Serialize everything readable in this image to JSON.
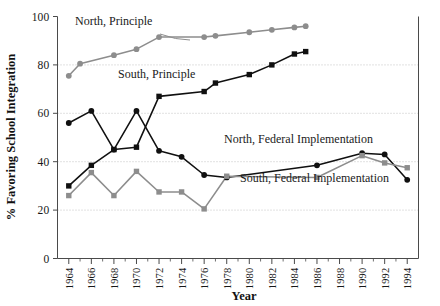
{
  "chart_data": {
    "type": "line",
    "title": "",
    "xlabel": "Year",
    "ylabel": "% Favoring School Integration",
    "xlim": [
      1963,
      1995
    ],
    "ylim": [
      0,
      100
    ],
    "grid": true,
    "legend_position": "inline-annotations",
    "y_ticks": [
      0,
      20,
      40,
      60,
      80,
      100
    ],
    "y_tick_labels": [
      "0",
      "20",
      "40",
      "60",
      "80",
      "100"
    ],
    "x_ticks": [
      1964,
      1966,
      1968,
      1970,
      1972,
      1974,
      1976,
      1978,
      1980,
      1982,
      1984,
      1986,
      1988,
      1990,
      1992,
      1994
    ],
    "x_tick_labels": [
      "1964",
      "1966",
      "1968",
      "1970",
      "1972",
      "1974",
      "1976",
      "1978",
      "1980",
      "1982",
      "1984",
      "1986",
      "1988",
      "1990",
      "1992",
      "1994"
    ],
    "series": [
      {
        "name": "North, Principle",
        "label": "North, Principle",
        "color": "#8d8d8d",
        "marker": "circle",
        "x": [
          1964,
          1965,
          1968,
          1970,
          1972,
          1976,
          1977,
          1980,
          1982,
          1984,
          1985
        ],
        "values": [
          75.5,
          80.5,
          84,
          86.5,
          91.5,
          91.5,
          92,
          93.5,
          94.5,
          95.5,
          96
        ]
      },
      {
        "name": "South, Principle",
        "label": "South, Principle",
        "color": "#101010",
        "marker": "square",
        "x": [
          1964,
          1966,
          1968,
          1970,
          1972,
          1976,
          1977,
          1980,
          1982,
          1984,
          1985
        ],
        "values": [
          30,
          38.5,
          45,
          46,
          67,
          69,
          72.5,
          76,
          80,
          84.5,
          85.5
        ]
      },
      {
        "name": "North, Federal Implementation",
        "label": "North, Federal Implementation",
        "color": "#101010",
        "marker": "circle",
        "x": [
          1964,
          1966,
          1968,
          1970,
          1972,
          1974,
          1976,
          1978,
          1986,
          1990,
          1992,
          1994
        ],
        "values": [
          56,
          61,
          45,
          61,
          44.5,
          42,
          34.5,
          33.5,
          38.5,
          43.5,
          43,
          32.5
        ]
      },
      {
        "name": "South, Federal Implementation",
        "label": "South, Federal Implementation",
        "color": "#8d8d8d",
        "marker": "square",
        "x": [
          1964,
          1966,
          1968,
          1970,
          1972,
          1974,
          1976,
          1978,
          1986,
          1990,
          1992,
          1994
        ],
        "values": [
          26,
          35.5,
          26,
          36,
          27.5,
          27.5,
          20.5,
          34,
          33.5,
          42.5,
          39.5,
          37.5
        ]
      }
    ],
    "annotations": [
      {
        "text": "North, Principle",
        "x": 75,
        "y": 25
      },
      {
        "text": "South, Principle",
        "x": 118,
        "y": 78
      },
      {
        "text": "North, Federal Implementation",
        "x": 224,
        "y": 143
      },
      {
        "text": "South, Federal Implementation",
        "x": 240,
        "y": 182
      }
    ]
  }
}
